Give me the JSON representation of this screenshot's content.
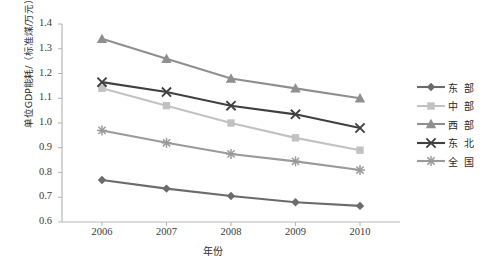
{
  "chart_data": {
    "type": "line",
    "title": "",
    "xlabel": "年份",
    "ylabel": "单位GDP能耗/（标准煤/万元）",
    "categories": [
      "2006",
      "2007",
      "2008",
      "2009",
      "2010"
    ],
    "x": [
      2006,
      2007,
      2008,
      2009,
      2010
    ],
    "ylim": [
      0.6,
      1.4
    ],
    "ytick_labels": [
      "0.6",
      "0.7",
      "0.8",
      "0.9",
      "1.0",
      "1.1",
      "1.2",
      "1.3",
      "1.4"
    ],
    "ytick_values": [
      0.6,
      0.7,
      0.8,
      0.9,
      1.0,
      1.1,
      1.2,
      1.3,
      1.4
    ],
    "grid": false,
    "legend_position": "right",
    "series": [
      {
        "name": "东部",
        "marker": "diamond",
        "color": "#6b6b6b",
        "values": [
          0.77,
          0.735,
          0.705,
          0.68,
          0.665
        ]
      },
      {
        "name": "中部",
        "marker": "square",
        "color": "#c2c2c2",
        "values": [
          1.14,
          1.07,
          1.0,
          0.94,
          0.89
        ]
      },
      {
        "name": "西部",
        "marker": "triangle",
        "color": "#8f8f8f",
        "values": [
          1.34,
          1.26,
          1.18,
          1.14,
          1.1
        ]
      },
      {
        "name": "东北",
        "marker": "x",
        "color": "#404040",
        "values": [
          1.165,
          1.125,
          1.07,
          1.035,
          0.98
        ]
      },
      {
        "name": "全国",
        "marker": "star",
        "color": "#9a9a9a",
        "values": [
          0.97,
          0.92,
          0.875,
          0.845,
          0.81
        ]
      }
    ]
  },
  "legend": {
    "items": [
      {
        "label": "东 部"
      },
      {
        "label": "中 部"
      },
      {
        "label": "西 部"
      },
      {
        "label": "东 北"
      },
      {
        "label": "全 国"
      }
    ]
  }
}
